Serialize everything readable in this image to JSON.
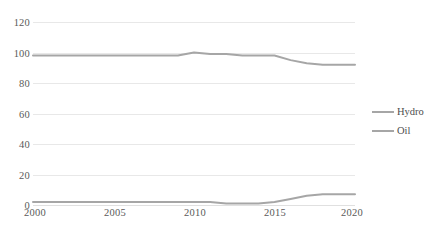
{
  "chart_data": {
    "type": "line",
    "title": "",
    "xlabel": "",
    "ylabel": "",
    "x": [
      2000,
      2001,
      2002,
      2003,
      2004,
      2005,
      2006,
      2007,
      2008,
      2009,
      2010,
      2011,
      2012,
      2013,
      2014,
      2015,
      2016,
      2017,
      2018,
      2019,
      2020
    ],
    "xlim": [
      2000,
      2020
    ],
    "ylim": [
      0,
      120
    ],
    "grid": true,
    "legend_position": "right",
    "series": [
      {
        "name": "Hydro",
        "color": "#a6a6a6",
        "values": [
          98,
          98,
          98,
          98,
          98,
          98,
          98,
          98,
          98,
          98,
          100,
          99,
          99,
          98,
          98,
          98,
          95,
          93,
          92,
          92,
          92
        ]
      },
      {
        "name": "Oil",
        "color": "#a6a6a6",
        "values": [
          2,
          2,
          2,
          2,
          2,
          2,
          2,
          2,
          2,
          2,
          2,
          2,
          1,
          1,
          1,
          2,
          4,
          6,
          7,
          7,
          7
        ]
      }
    ],
    "y_ticks": [
      0,
      20,
      40,
      60,
      80,
      100,
      120
    ],
    "x_ticks": [
      2000,
      2005,
      2010,
      2015,
      2020
    ],
    "x_tick_labels": [
      "2000",
      "2005",
      "2010",
      "2015",
      "2020"
    ],
    "y_tick_labels": [
      "0",
      "20",
      "40",
      "60",
      "80",
      "100",
      "120"
    ],
    "gridline_color": "#e8e8e8",
    "tick_label_color": "#5a5a5a"
  },
  "legend": {
    "items": [
      {
        "label": "Hydro"
      },
      {
        "label": "Oil"
      }
    ]
  }
}
